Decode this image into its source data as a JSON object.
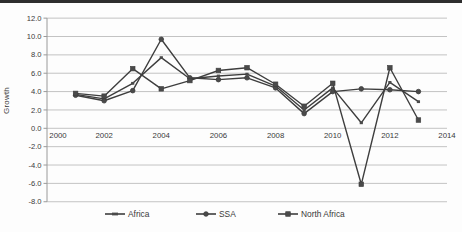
{
  "chart_data": {
    "type": "line",
    "title": "",
    "ylabel": "Growth",
    "xlabel": "",
    "xlim": [
      2000,
      2014
    ],
    "ylim": [
      -8,
      12
    ],
    "xticks": [
      2000,
      2002,
      2004,
      2006,
      2008,
      2010,
      2012,
      2014
    ],
    "yticks": [
      12,
      10,
      8,
      6,
      4,
      2,
      0,
      -2,
      -4,
      -6,
      -8
    ],
    "grid": true,
    "legend_position": "bottom",
    "x": [
      2001,
      2002,
      2003,
      2004,
      2005,
      2006,
      2007,
      2008,
      2009,
      2010,
      2011,
      2012,
      2013
    ],
    "series": [
      {
        "name": "Africa",
        "marker": "dash",
        "values": [
          3.7,
          3.2,
          4.9,
          7.7,
          5.4,
          5.7,
          5.9,
          4.6,
          2.0,
          4.4,
          0.6,
          5.0,
          2.9
        ]
      },
      {
        "name": "SSA",
        "marker": "circle",
        "values": [
          3.6,
          3.0,
          4.1,
          9.7,
          5.5,
          5.3,
          5.5,
          4.4,
          1.6,
          4.0,
          4.3,
          4.2,
          4.0
        ]
      },
      {
        "name": "North Africa",
        "marker": "square",
        "values": [
          3.8,
          3.5,
          6.5,
          4.3,
          5.2,
          6.3,
          6.6,
          4.8,
          2.4,
          4.9,
          -6.1,
          6.6,
          0.9
        ]
      }
    ],
    "colors": {
      "series_line": "#3e3e3e",
      "marker_fill": "#4a4a4a",
      "gridline": "#bcbcbc",
      "axis_line": "#9a9a9a",
      "tick_text": "#3a3a3a",
      "top_rule": "#2e2e2e"
    }
  }
}
